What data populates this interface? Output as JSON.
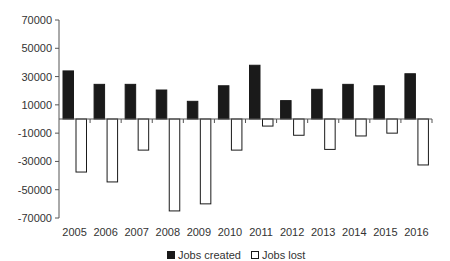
{
  "chart_data": {
    "type": "bar",
    "title": "",
    "xlabel": "",
    "ylabel": "",
    "categories": [
      "2005",
      "2006",
      "2007",
      "2008",
      "2009",
      "2010",
      "2011",
      "2012",
      "2013",
      "2014",
      "2015",
      "2016"
    ],
    "series": [
      {
        "name": "Jobs created",
        "color": "#1a1a1a",
        "values": [
          34000,
          24500,
          24500,
          20500,
          12500,
          23500,
          38000,
          13000,
          21000,
          24500,
          23500,
          32000
        ]
      },
      {
        "name": "Jobs lost",
        "color": "#ffffff",
        "values": [
          -37500,
          -44500,
          -22000,
          -65000,
          -60000,
          -22000,
          -5000,
          -11500,
          -21500,
          -12000,
          -10000,
          -32500
        ]
      }
    ],
    "y_ticks": [
      70000,
      50000,
      30000,
      10000,
      -10000,
      -30000,
      -50000,
      -70000
    ],
    "ylim": [
      -70000,
      70000
    ],
    "grid": false,
    "legend_position": "bottom"
  },
  "legend": {
    "items": [
      {
        "label": "Jobs created"
      },
      {
        "label": "Jobs lost"
      }
    ]
  }
}
